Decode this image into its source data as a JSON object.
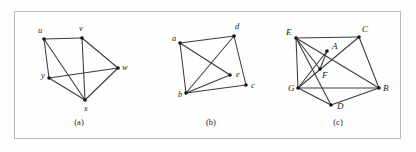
{
  "figure": {
    "background_color": "#fdfdfc",
    "frame_color": "#b9b9b9",
    "edge_color": "#3a3a3a",
    "vertex_color": "#161616",
    "label_color": "#1c1c1c",
    "panels": [
      {
        "id": "a",
        "caption": "(a)",
        "caption_x": 79,
        "caption_y": 125,
        "vertices": [
          {
            "name": "u",
            "x": 44,
            "y": 39,
            "label": "u",
            "label_x": 38,
            "label_y": 33
          },
          {
            "name": "v",
            "x": 82,
            "y": 38,
            "label": "v",
            "label_x": 79,
            "label_y": 31
          },
          {
            "name": "w",
            "x": 118,
            "y": 68,
            "label": "w",
            "label_x": 122,
            "label_y": 70
          },
          {
            "name": "y",
            "x": 49,
            "y": 78,
            "label": "y",
            "label_x": 41,
            "label_y": 78
          },
          {
            "name": "x",
            "x": 85,
            "y": 100,
            "label": "x",
            "label_x": 84,
            "label_y": 111
          }
        ],
        "edges": [
          [
            "u",
            "v"
          ],
          [
            "u",
            "y"
          ],
          [
            "u",
            "x"
          ],
          [
            "v",
            "w"
          ],
          [
            "v",
            "x"
          ],
          [
            "y",
            "w"
          ],
          [
            "y",
            "x"
          ],
          [
            "x",
            "w"
          ]
        ]
      },
      {
        "id": "b",
        "caption": "(b)",
        "caption_x": 211,
        "caption_y": 125,
        "vertices": [
          {
            "name": "a",
            "x": 180,
            "y": 43,
            "label": "a",
            "label_x": 172,
            "label_y": 41
          },
          {
            "name": "d",
            "x": 234,
            "y": 36,
            "label": "d",
            "label_x": 235,
            "label_y": 29
          },
          {
            "name": "e",
            "x": 230,
            "y": 75,
            "label": "e",
            "label_x": 236,
            "label_y": 77
          },
          {
            "name": "c",
            "x": 246,
            "y": 85,
            "label": "c",
            "label_x": 251,
            "label_y": 88
          },
          {
            "name": "b",
            "x": 186,
            "y": 93,
            "label": "b",
            "label_x": 178,
            "label_y": 97
          }
        ],
        "edges": [
          [
            "a",
            "d"
          ],
          [
            "a",
            "b"
          ],
          [
            "a",
            "e"
          ],
          [
            "b",
            "d"
          ],
          [
            "b",
            "e"
          ],
          [
            "b",
            "c"
          ],
          [
            "d",
            "c"
          ]
        ]
      },
      {
        "id": "c",
        "caption": "(c)",
        "caption_x": 338,
        "caption_y": 125,
        "vertices": [
          {
            "name": "E",
            "x": 296,
            "y": 38,
            "label": "E",
            "label_x": 286,
            "label_y": 35
          },
          {
            "name": "C",
            "x": 359,
            "y": 37,
            "label": "C",
            "label_x": 362,
            "label_y": 32
          },
          {
            "name": "A",
            "x": 327,
            "y": 51,
            "label": "A",
            "label_x": 332,
            "label_y": 49
          },
          {
            "name": "F",
            "x": 320,
            "y": 69,
            "label": "F",
            "label_x": 322,
            "label_y": 78
          },
          {
            "name": "G",
            "x": 298,
            "y": 88,
            "label": "G",
            "label_x": 288,
            "label_y": 91
          },
          {
            "name": "B",
            "x": 379,
            "y": 88,
            "label": "B",
            "label_x": 383,
            "label_y": 91
          },
          {
            "name": "D",
            "x": 331,
            "y": 105,
            "label": "D",
            "label_x": 337,
            "label_y": 109
          }
        ],
        "edges": [
          [
            "E",
            "C"
          ],
          [
            "E",
            "G"
          ],
          [
            "E",
            "F"
          ],
          [
            "E",
            "D"
          ],
          [
            "E",
            "B"
          ],
          [
            "A",
            "F"
          ],
          [
            "A",
            "G"
          ],
          [
            "C",
            "B"
          ],
          [
            "C",
            "G"
          ],
          [
            "G",
            "B"
          ],
          [
            "G",
            "D"
          ],
          [
            "B",
            "D"
          ]
        ]
      }
    ]
  }
}
